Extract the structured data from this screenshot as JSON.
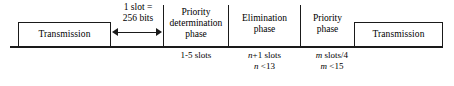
{
  "figure": {
    "background_color": "#ffffff",
    "line_color": "#1a1a1a",
    "text_color": "#000000"
  },
  "blocks": {
    "transmission_left": "Transmission",
    "transmission_right": "Transmission"
  },
  "slot_caption": {
    "line1": "1 slot =",
    "line2": "256 bits"
  },
  "phases": [
    {
      "name": "priority-determination-phase",
      "line1": "Priority",
      "line2": "determination",
      "line3": "phase",
      "annotation_line1": "1-5 slots",
      "annotation_line2": ""
    },
    {
      "name": "elimination-phase",
      "line1": "Elimination",
      "line2": "phase",
      "line3": "",
      "annotation_prefix1": "n",
      "annotation_rest1": "+1 slots",
      "annotation_prefix2": "n",
      "annotation_rest2": " <13"
    },
    {
      "name": "priority-phase",
      "line1": "Priority",
      "line2": "phase",
      "line3": "",
      "annotation_prefix1": "m",
      "annotation_rest1": " slots/4",
      "annotation_prefix2": "m",
      "annotation_rest2": " <15"
    }
  ]
}
